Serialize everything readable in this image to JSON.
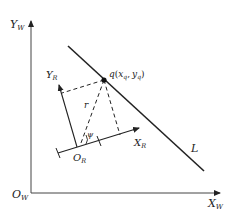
{
  "diagram": {
    "title": "",
    "colors": {
      "stroke": "#222222",
      "background": "#ffffff"
    },
    "world_frame": {
      "origin_label": "O",
      "origin_sub": "W",
      "x_axis_label": "X",
      "x_axis_sub": "W",
      "y_axis_label": "Y",
      "y_axis_sub": "W"
    },
    "robot_frame": {
      "origin_label": "O",
      "origin_sub": "R",
      "x_axis_label": "X",
      "x_axis_sub": "R",
      "y_axis_label": "Y",
      "y_axis_sub": "R"
    },
    "line_label": "L",
    "point": {
      "name": "q",
      "coords_open": "(",
      "x": "x",
      "x_sub": "q",
      "sep": ",",
      "y": "y",
      "y_sub": "q",
      "coords_close": ")"
    },
    "distance_label": "r",
    "angle_label": "ψ"
  }
}
